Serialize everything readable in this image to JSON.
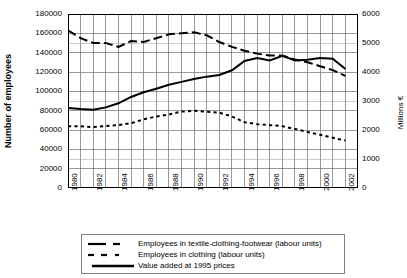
{
  "chart_data": {
    "type": "line",
    "title": "",
    "subtitle": "",
    "xlabel": "",
    "ylabel": "Number of employees",
    "ylabel_right": "Millions €",
    "xlim": [
      1980,
      2003
    ],
    "ylim": [
      0,
      180000
    ],
    "ylim_right": [
      0,
      6000
    ],
    "grid": true,
    "legend_position": "bottom",
    "x": [
      1980,
      1981,
      1982,
      1983,
      1984,
      1985,
      1986,
      1987,
      1988,
      1989,
      1990,
      1991,
      1992,
      1993,
      1994,
      1995,
      1996,
      1997,
      1998,
      1999,
      2000,
      2001,
      2002
    ],
    "x_tick_labels": [
      "1980",
      "1982",
      "1984",
      "1986",
      "1988",
      "1990",
      "1992",
      "1994",
      "1996",
      "1998",
      "2000",
      "2002"
    ],
    "y_tick_labels_left": [
      "0",
      "20000",
      "40000",
      "60000",
      "80000",
      "100000",
      "120000",
      "140000",
      "160000",
      "180000"
    ],
    "y_tick_labels_right": [
      "0",
      "1000",
      "2000",
      "3000",
      "4000",
      "5000",
      "6000"
    ],
    "series": [
      {
        "name": "Employees in textile-clothing-footwear (labour units)",
        "axis": "left",
        "style": "long-dash",
        "color": "#000000",
        "values": [
          163000,
          155000,
          150000,
          150000,
          146000,
          152000,
          151000,
          155000,
          159000,
          160000,
          161000,
          158000,
          151000,
          146000,
          142000,
          139000,
          137000,
          137000,
          133000,
          130000,
          126000,
          122000,
          116000
        ]
      },
      {
        "name": "Employees in clothing (labour units)",
        "axis": "left",
        "style": "dotted",
        "color": "#000000",
        "values": [
          64000,
          64000,
          63000,
          64000,
          65000,
          67000,
          71000,
          74000,
          76000,
          79000,
          80000,
          79000,
          78000,
          74000,
          68000,
          66000,
          65000,
          64000,
          61000,
          58000,
          55000,
          52000,
          49000
        ]
      },
      {
        "name": "Value added at 1995 prices",
        "axis": "right",
        "style": "solid",
        "color": "#000000",
        "values": [
          2760,
          2720,
          2700,
          2780,
          2920,
          3140,
          3300,
          3420,
          3560,
          3660,
          3760,
          3840,
          3900,
          4060,
          4380,
          4480,
          4400,
          4560,
          4400,
          4420,
          4480,
          4460,
          4100
        ]
      }
    ]
  },
  "axes": {
    "left_title": "Number of employees",
    "right_title": "Millions €"
  },
  "legend": {
    "items": [
      {
        "label": "Employees in textile-clothing-footwear (labour units)",
        "style": "long-dash"
      },
      {
        "label": "Employees in clothing (labour units)",
        "style": "dotted"
      },
      {
        "label": "Value added at 1995 prices",
        "style": "solid"
      }
    ]
  }
}
